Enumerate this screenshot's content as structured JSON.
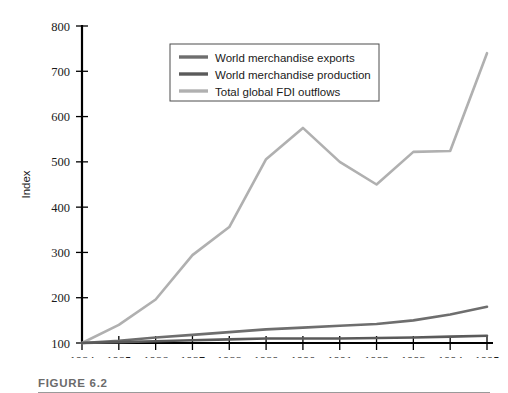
{
  "figure": {
    "caption_label": "FIGURE 6.2",
    "caption_text": "Growth of FDI, World Trade, and World Output, Indexed 100 to 1984"
  },
  "chart_data": {
    "type": "line",
    "title": "",
    "xlabel": "",
    "ylabel": "Index",
    "x": [
      1984,
      1985,
      1986,
      1987,
      1988,
      1989,
      1990,
      1991,
      1992,
      1993,
      1994,
      1995
    ],
    "categories": [
      "1984",
      "1985",
      "1986",
      "1987",
      "1988",
      "1989",
      "1990",
      "1991",
      "1992",
      "1993",
      "1994",
      "1995"
    ],
    "xlim": [
      1984,
      1995
    ],
    "ylim": [
      100,
      800
    ],
    "yticks": [
      100,
      200,
      300,
      400,
      500,
      600,
      700,
      800
    ],
    "ytick_labels": [
      "100",
      "200",
      "300",
      "400",
      "500",
      "600",
      "700",
      "800"
    ],
    "grid": false,
    "legend_position": "upper center",
    "series": [
      {
        "name": "World merchandise exports",
        "color": "#6e6e6e",
        "values": [
          100,
          105,
          112,
          118,
          124,
          130,
          134,
          138,
          142,
          150,
          163,
          180
        ]
      },
      {
        "name": "World merchandise production",
        "color": "#5a5a5a",
        "values": [
          100,
          102,
          104,
          106,
          108,
          110,
          110,
          110,
          111,
          112,
          114,
          116
        ]
      },
      {
        "name": "Total global FDI outflows",
        "color": "#b0b0b0",
        "values": [
          100,
          140,
          196,
          294,
          356,
          506,
          575,
          500,
          450,
          522,
          524,
          740
        ]
      }
    ]
  },
  "legend": {
    "items": [
      {
        "label": "World merchandise exports",
        "color": "#6e6e6e"
      },
      {
        "label": "World merchandise production",
        "color": "#5a5a5a"
      },
      {
        "label": "Total global FDI outflows",
        "color": "#b0b0b0"
      }
    ]
  },
  "colors": {
    "axis": "#000000",
    "text": "#1a1a1a",
    "caption": "#6b6b6b",
    "rule": "#9a9a9a",
    "background": "#ffffff"
  }
}
